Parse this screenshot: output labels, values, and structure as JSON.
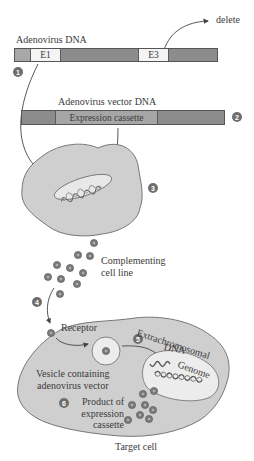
{
  "diagram": {
    "adenovirus_dna": {
      "title": "Adenovirus DNA",
      "segments": [
        {
          "label": "",
          "fill": "#a8a8a8"
        },
        {
          "label": "E1",
          "fill": "#f4f4f4"
        },
        {
          "label": "",
          "fill": "#8c8c8c"
        },
        {
          "label": "E3",
          "fill": "#f4f4f4"
        },
        {
          "label": "",
          "fill": "#8c8c8c"
        }
      ],
      "delete_label": "delete"
    },
    "vector_dna": {
      "title": "Adenovirus vector DNA",
      "segments": [
        {
          "label": "",
          "fill": "#8c8c8c"
        },
        {
          "label": "Expression cassette",
          "fill": "#a6a6a6"
        },
        {
          "label": "",
          "fill": "#8c8c8c"
        }
      ]
    },
    "complementing": {
      "label_line1": "Complementing",
      "label_line2": "cell line"
    },
    "target_cell": {
      "receptor": "Receptor",
      "extrachromosomal_line1": "Extrachromosomal",
      "extrachromosomal_line2": "DNA",
      "genome": "Genome",
      "vesicle_line1": "Vesicle containing",
      "vesicle_line2": "adenovirus vector",
      "product_line1": "Product of",
      "product_line2": "expression",
      "product_line3": "cassette",
      "caption": "Target cell"
    },
    "steps": [
      "1",
      "2",
      "3",
      "4",
      "5",
      "6"
    ],
    "colors": {
      "cell_fill": "#cfcfcf",
      "cell_stroke": "#6a6a6a",
      "nucleus_fill": "#eeeeee",
      "step_badge": "#6e6e6e",
      "virus_particle": "#7a7a7a",
      "arrow": "#444444"
    }
  }
}
